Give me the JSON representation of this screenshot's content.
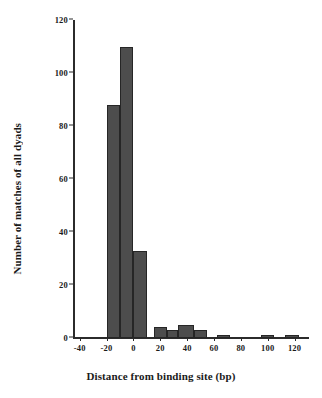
{
  "chart_data": {
    "type": "bar",
    "title": "",
    "xlabel": "Distance from binding site (bp)",
    "ylabel": "Number of matches of all dyads",
    "xlim": [
      -45,
      130
    ],
    "ylim": [
      0,
      120
    ],
    "grid": false,
    "legend": "none",
    "xticks": [
      "-40",
      "-20",
      "0",
      "20",
      "40",
      "60",
      "80",
      "100",
      "120"
    ],
    "xtick_values": [
      -40,
      -20,
      0,
      20,
      40,
      60,
      80,
      100,
      120
    ],
    "yticks": [
      "0",
      "20",
      "40",
      "60",
      "80",
      "100",
      "120"
    ],
    "ytick_values": [
      0,
      20,
      40,
      60,
      80,
      100,
      120
    ],
    "bin_width": 10,
    "bins": [
      {
        "left": -20,
        "right": -10,
        "center": -15,
        "value": 88
      },
      {
        "left": -10,
        "right": 0,
        "center": -5,
        "value": 110
      },
      {
        "left": 0,
        "right": 10,
        "center": 5,
        "value": 33
      },
      {
        "left": 15,
        "right": 25,
        "center": 20,
        "value": 4
      },
      {
        "left": 25,
        "right": 33,
        "center": 29,
        "value": 3
      },
      {
        "left": 33,
        "right": 45,
        "center": 39,
        "value": 5
      },
      {
        "left": 45,
        "right": 55,
        "center": 50,
        "value": 3
      },
      {
        "left": 62,
        "right": 72,
        "center": 67,
        "value": 1
      },
      {
        "left": 95,
        "right": 105,
        "center": 100,
        "value": 1
      },
      {
        "left": 113,
        "right": 123,
        "center": 118,
        "value": 1
      }
    ],
    "categories": [
      -15,
      -5,
      5,
      20,
      29,
      39,
      50,
      67,
      100,
      118
    ],
    "values": [
      88,
      110,
      33,
      4,
      3,
      5,
      3,
      1,
      1,
      1
    ],
    "bar_color": "#4d4d4d",
    "bar_edge_color": "#262626",
    "axis_color": "#2b2b2b"
  }
}
